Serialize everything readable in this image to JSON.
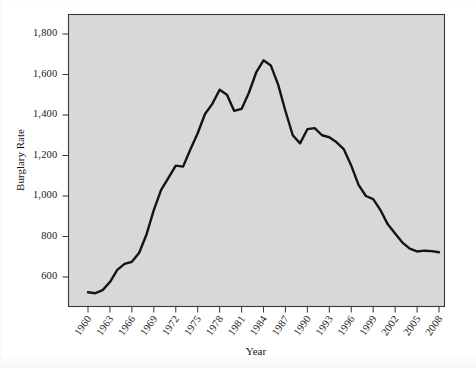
{
  "chart_data": {
    "type": "line",
    "title": "",
    "xlabel": "Year",
    "ylabel": "Burglary Rate",
    "grid": false,
    "legend": "none",
    "xlim": [
      1960,
      2008
    ],
    "ylim": [
      500,
      1880
    ],
    "ytick_labels": [
      "1,800",
      "1,600",
      "1,400",
      "1,200",
      "1,000",
      "800",
      "600"
    ],
    "ytick_values": [
      1800,
      1600,
      1400,
      1200,
      1000,
      800,
      600
    ],
    "xtick_labels": [
      "1960",
      "1963",
      "1966",
      "1969",
      "1972",
      "1975",
      "1978",
      "1981",
      "1984",
      "1987",
      "1990",
      "1993",
      "1996",
      "1999",
      "2002",
      "2005",
      "2008"
    ],
    "xtick_values": [
      1960,
      1963,
      1966,
      1969,
      1972,
      1975,
      1978,
      1981,
      1984,
      1987,
      1990,
      1993,
      1996,
      1999,
      2002,
      2005,
      2008
    ],
    "series": [
      {
        "name": "Burglary Rate",
        "color": "#141414",
        "x": [
          1960,
          1961,
          1962,
          1963,
          1964,
          1965,
          1966,
          1967,
          1968,
          1969,
          1970,
          1971,
          1972,
          1973,
          1974,
          1975,
          1976,
          1977,
          1978,
          1979,
          1980,
          1981,
          1982,
          1983,
          1984,
          1985,
          1986,
          1987,
          1988,
          1989,
          1990,
          1991,
          1992,
          1993,
          1994,
          1995,
          1996,
          1997,
          1998,
          1999,
          2000,
          2001,
          2002,
          2003,
          2004,
          2005,
          2006,
          2007,
          2008
        ],
        "y": [
          525,
          520,
          535,
          575,
          635,
          665,
          675,
          720,
          810,
          930,
          1030,
          1090,
          1150,
          1145,
          1230,
          1310,
          1405,
          1455,
          1525,
          1500,
          1420,
          1430,
          1510,
          1610,
          1670,
          1645,
          1550,
          1420,
          1300,
          1260,
          1330,
          1335,
          1300,
          1290,
          1265,
          1230,
          1150,
          1055,
          1000,
          985,
          930,
          860,
          815,
          770,
          740,
          726,
          730,
          728,
          722
        ]
      }
    ],
    "annotations": []
  },
  "figure": {
    "background_color": "#ffffff",
    "plot_background_color": "#d8d8d8",
    "plot_border_color": "#3a3a3a",
    "line_color": "#141414"
  },
  "watermark": {
    "text": ""
  }
}
